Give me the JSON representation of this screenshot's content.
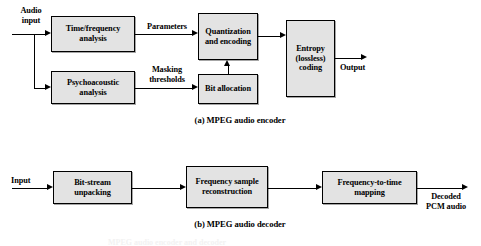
{
  "figure": {
    "title_note": "MPEG audio encoder and decoder block diagrams",
    "bg_color": "#ffffff",
    "box_fill": "#e3e3e3",
    "line_color": "#000000"
  },
  "encoder": {
    "caption": "(a) MPEG audio encoder",
    "input_label": "Audio\ninput",
    "output_label": "Output",
    "boxes": [
      {
        "id": "time-frequency-analysis",
        "label": "Time/frequency\nanalysis"
      },
      {
        "id": "psychoacoustic-analysis",
        "label": "Psychoacoustic\nanalysis"
      },
      {
        "id": "quantization-and-encoding",
        "label": "Quantization\nand\nencoding"
      },
      {
        "id": "bit-allocation",
        "label": "Bit\nallocation"
      },
      {
        "id": "entropy-lossless-coding",
        "label": "Entropy\n(lossless)\ncoding"
      }
    ],
    "edge_labels": [
      {
        "id": "parameters",
        "label": "Parameters"
      },
      {
        "id": "masking-thresholds",
        "label": "Masking\nthresholds"
      }
    ]
  },
  "decoder": {
    "caption": "(b) MPEG audio decoder",
    "input_label": "Input",
    "output_label": "Decoded\nPCM audio",
    "boxes": [
      {
        "id": "bit-stream-unpacking",
        "label": "Bit-stream\nunpacking"
      },
      {
        "id": "frequency-sample-reconstruction",
        "label": "Frequency\nsample\nreconstruction"
      },
      {
        "id": "frequency-to-time-mapping",
        "label": "Frequency-to-time\nmapping"
      }
    ]
  },
  "footer": {
    "clipped_text": "MPEG audio encoder and decoder"
  }
}
